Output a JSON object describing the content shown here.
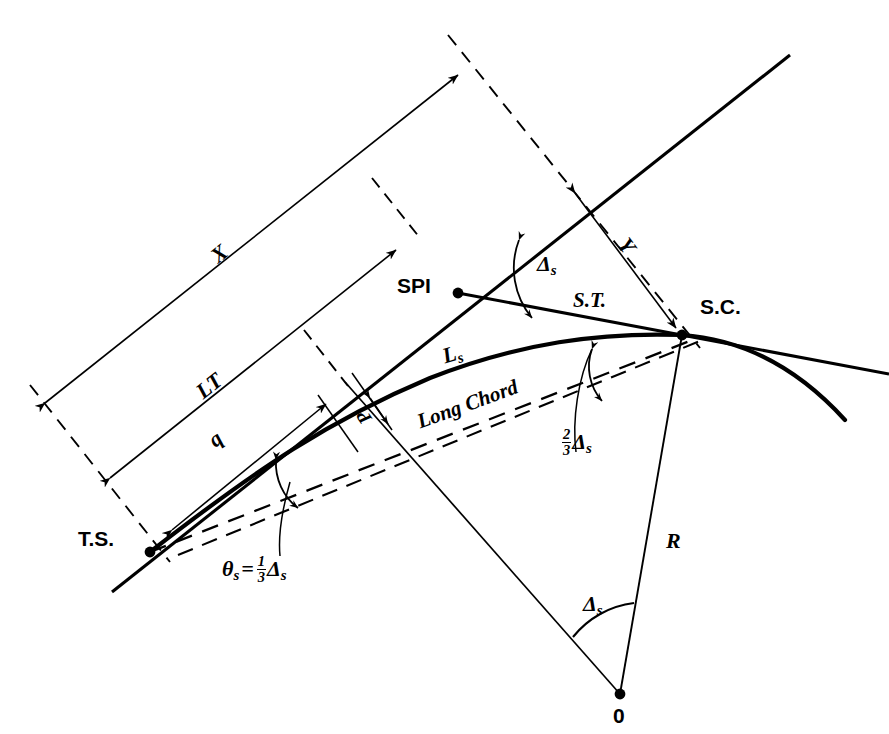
{
  "diagram": {
    "stroke_color": "#000000",
    "background_color": "#ffffff",
    "points": [
      {
        "id": "ts",
        "label": "T.S.",
        "x": 150,
        "y": 552
      },
      {
        "id": "spi",
        "label": "SPI",
        "x": 458,
        "y": 293
      },
      {
        "id": "sc",
        "label": "S.C.",
        "x": 682,
        "y": 335
      },
      {
        "id": "o",
        "label": "0",
        "x": 620,
        "y": 694
      }
    ],
    "labels": {
      "ts": "T.S.",
      "spi": "SPI",
      "sc": "S.C.",
      "st": "S.T.",
      "center": "0",
      "x_dim": "X",
      "y_dim": "Y",
      "lt_dim": "LT",
      "q_dim": "q",
      "p_dim": "P",
      "r_dim": "R",
      "ls_curve": "Ls",
      "long_chord": "Long Chord",
      "delta_s": "Δs",
      "two_thirds_delta_s": "⅔ Δs",
      "theta_s_equation": "θs = ⅓ Δs"
    },
    "symbols": {
      "delta": "Δ",
      "theta": "θ",
      "sub_s": "s",
      "equals": "=",
      "frac_one_third_num": "1",
      "frac_one_third_den": "3",
      "frac_two_thirds_num": "2",
      "frac_two_thirds_den": "3",
      "L": "L",
      "R": "R",
      "X": "X",
      "Y": "Y",
      "LT": "LT",
      "q": "q",
      "P": "P",
      "long_chord": "Long Chord"
    },
    "angles": [
      {
        "id": "delta-at-spi",
        "label": "Δs",
        "vertex": "SPI",
        "between": [
          "main tangent",
          "spiral long tangent S.T."
        ]
      },
      {
        "id": "two-thirds-delta-at-sc",
        "label": "⅔ Δs",
        "vertex": "S.C.",
        "between": [
          "S.T. line",
          "Long Chord"
        ]
      },
      {
        "id": "theta-at-ts",
        "label": "θs = ⅓ Δs",
        "vertex": "T.S.",
        "between": [
          "main tangent",
          "Long Chord"
        ]
      },
      {
        "id": "delta-at-center",
        "label": "Δs",
        "vertex": "0",
        "between": [
          "radius to S.C.",
          "radius to offset point"
        ]
      }
    ],
    "dimensions": [
      {
        "id": "X",
        "label": "X",
        "description": "tangent distance T.S. to S.C. projection"
      },
      {
        "id": "Y",
        "label": "Y",
        "description": "offset from main tangent to S.C."
      },
      {
        "id": "LT",
        "label": "LT",
        "description": "long tangent of spiral"
      },
      {
        "id": "q",
        "label": "q",
        "description": "tangent offset distance"
      },
      {
        "id": "P",
        "label": "P",
        "description": "throw / offset of circular curve"
      },
      {
        "id": "R",
        "label": "R",
        "description": "radius of circular curve"
      },
      {
        "id": "Ls",
        "label": "Ls",
        "description": "length of spiral"
      }
    ]
  }
}
